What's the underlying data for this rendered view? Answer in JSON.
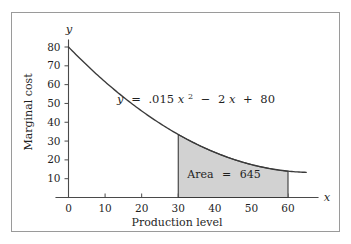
{
  "figure": {
    "border_color": "#9a9a9a",
    "background": "#ffffff"
  },
  "chart_data": {
    "type": "area",
    "title": "",
    "subtitle": "",
    "xlabel": "Production level",
    "ylabel": "Marginal cost",
    "x_axis_symbol": "x",
    "y_axis_symbol": "y",
    "xlim": [
      0,
      65
    ],
    "ylim": [
      0,
      86
    ],
    "xticks": [
      0,
      10,
      20,
      30,
      40,
      50,
      60
    ],
    "xtick_labels": [
      "0",
      "10",
      "20",
      "30",
      "40",
      "50",
      "60"
    ],
    "yticks": [
      10,
      20,
      30,
      40,
      50,
      60,
      70,
      80
    ],
    "ytick_labels": [
      "10",
      "20",
      "30",
      "40",
      "50",
      "60",
      "70",
      "80"
    ],
    "grid": false,
    "legend": "none",
    "equation": {
      "lhs": "y",
      "eq": "=",
      "coef_quadratic": ".015",
      "var_quadratic": "x",
      "exponent": "2",
      "minus": "−",
      "coef_linear": "2",
      "var_linear": "x",
      "plus": "+",
      "constant": "80",
      "plain_text": "y = .015x² − 2x + 80"
    },
    "curve": {
      "name": "Marginal cost curve",
      "function": "0.015*x^2 - 2*x + 80",
      "x_start": 0,
      "x_end": 65,
      "points": [
        {
          "x": 0,
          "y": 80.0
        },
        {
          "x": 5,
          "y": 70.4
        },
        {
          "x": 10,
          "y": 61.5
        },
        {
          "x": 15,
          "y": 53.4
        },
        {
          "x": 20,
          "y": 46.0
        },
        {
          "x": 25,
          "y": 39.4
        },
        {
          "x": 30,
          "y": 33.5
        },
        {
          "x": 35,
          "y": 28.4
        },
        {
          "x": 40,
          "y": 24.0
        },
        {
          "x": 45,
          "y": 20.4
        },
        {
          "x": 50,
          "y": 17.5
        },
        {
          "x": 55,
          "y": 15.4
        },
        {
          "x": 60,
          "y": 14.0
        },
        {
          "x": 65,
          "y": 13.4
        }
      ]
    },
    "shaded_region": {
      "label": "Area",
      "equals": "=",
      "value": "645",
      "label_text": "Area = 645",
      "x_from": 30,
      "x_to": 60,
      "y_at_x_from": 33.5,
      "y_at_x_to": 14.0,
      "fill_color": "#d2d2d2",
      "edge_color": "#3a3a3a"
    }
  }
}
